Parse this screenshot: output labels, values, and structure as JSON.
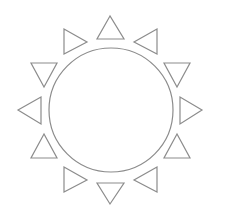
{
  "figure": {
    "background": "#ffffff",
    "stroke_color": "#8c8c8c",
    "stroke_width": 1.2
  },
  "sun": {
    "circle": {
      "cx": 111,
      "cy": 110,
      "r": 62
    },
    "rays": [
      {
        "name": "ray-top",
        "direction": "up",
        "points": "110,16 97,39 124,39"
      },
      {
        "name": "ray-top-left",
        "direction": "right",
        "points": "64,29 64,54 87,42"
      },
      {
        "name": "ray-top-right",
        "direction": "left",
        "points": "157,29 157,54 134,42"
      },
      {
        "name": "ray-upper-left",
        "direction": "down",
        "points": "31,63 57,63 44,87"
      },
      {
        "name": "ray-upper-right",
        "direction": "down",
        "points": "164,63 190,63 177,87"
      },
      {
        "name": "ray-left",
        "direction": "left",
        "points": "18,110 41,97 41,124"
      },
      {
        "name": "ray-right",
        "direction": "right",
        "points": "202,110 180,97 180,124"
      },
      {
        "name": "ray-lower-left",
        "direction": "up",
        "points": "44,134 31,158 57,158"
      },
      {
        "name": "ray-lower-right",
        "direction": "up",
        "points": "177,134 164,158 190,158"
      },
      {
        "name": "ray-bottom-left",
        "direction": "right",
        "points": "64,167 64,192 87,180"
      },
      {
        "name": "ray-bottom",
        "direction": "down",
        "points": "97,183 124,183 110,204"
      },
      {
        "name": "ray-bottom-right",
        "direction": "left",
        "points": "157,167 157,192 134,180"
      }
    ]
  }
}
